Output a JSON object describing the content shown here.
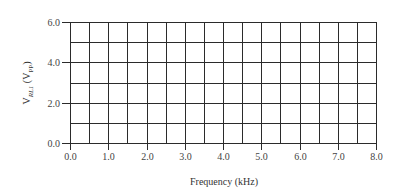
{
  "chart_data": {
    "type": "line",
    "title": "",
    "xlabel": "Frequency (kHz)",
    "ylabel": {
      "main": "V",
      "main_sub": "RL1",
      "unit": "V",
      "unit_sub": "PP"
    },
    "xlim": [
      0.0,
      8.0
    ],
    "ylim": [
      0.0,
      6.0
    ],
    "x_ticks": [
      "0.0",
      "1.0",
      "2.0",
      "3.0",
      "4.0",
      "5.0",
      "6.0",
      "7.0",
      "8.0"
    ],
    "y_ticks": [
      "0.0",
      "2.0",
      "4.0",
      "6.0"
    ],
    "x_grid_step": 0.5,
    "y_grid_step": 1.0,
    "grid": true,
    "series": [],
    "legend": null
  }
}
